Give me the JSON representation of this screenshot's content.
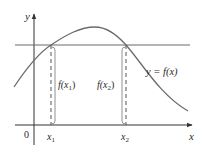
{
  "figure": {
    "type": "function-graph-rolles-theorem",
    "colors": {
      "axis": "#333333",
      "curve": "#6b6b6b",
      "horizontal_line": "#6b6b6b",
      "dashed": "#555555",
      "text": "#2a2a2a"
    },
    "axes": {
      "x_label": "x",
      "y_label": "y",
      "origin_label": "0"
    },
    "curve_label": "y = f(x)",
    "points": [
      {
        "tick_label": "x",
        "tick_sub": "1",
        "value_label": "f(x",
        "value_sub": "1",
        "value_close": ")"
      },
      {
        "tick_label": "x",
        "tick_sub": "2",
        "value_label": "f(x",
        "value_sub": "2",
        "value_close": ")"
      }
    ],
    "annotation": "f(x1) = f(x2), horizontal line intersects curve at x1 and x2"
  }
}
